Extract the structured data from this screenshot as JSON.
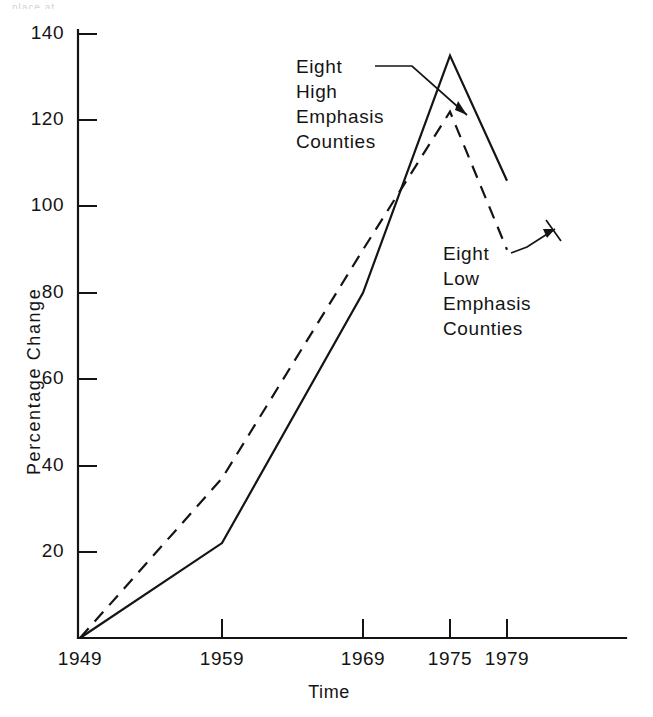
{
  "scan": {
    "artifact_text": "place at"
  },
  "chart_data": {
    "type": "line",
    "title": "",
    "subtitle": "",
    "xlabel": "Time",
    "ylabel": "Percentage Change",
    "x": [
      "1949",
      "1959",
      "1969",
      "1975",
      "1979"
    ],
    "xtick_labels": [
      "1949",
      "1959",
      "1969",
      "1975",
      "1979"
    ],
    "ytick_labels": [
      "20",
      "40",
      "60",
      "80",
      "100",
      "120",
      "140"
    ],
    "ytick_values": [
      20,
      40,
      60,
      80,
      100,
      120,
      140
    ],
    "ylim": [
      0,
      140
    ],
    "grid": false,
    "legend_position": "inline-annotations",
    "series": [
      {
        "name": "Eight High Emphasis Counties",
        "style": "solid",
        "color": "#141414",
        "values": [
          0,
          22,
          80,
          135,
          106
        ]
      },
      {
        "name": "Eight Low Emphasis Counties",
        "style": "dashed",
        "color": "#141414",
        "values": [
          0,
          37,
          90,
          122,
          90
        ]
      }
    ],
    "annotations": [
      {
        "id": "high-emphasis",
        "lines": [
          "Eight",
          "High",
          "Emphasis",
          "Counties"
        ],
        "points_to_series": "Eight High Emphasis Counties"
      },
      {
        "id": "low-emphasis",
        "lines": [
          "Eight",
          "Low",
          "Emphasis",
          "Counties"
        ],
        "points_to_series": "Eight Low Emphasis Counties"
      }
    ]
  }
}
